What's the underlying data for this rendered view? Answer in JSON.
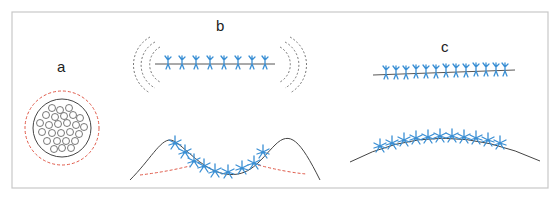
{
  "figure": {
    "panels": [
      {
        "id": "a",
        "label": "a",
        "description": "cross-section of circular structure with internal circles and dashed red outer ring"
      },
      {
        "id": "b",
        "label": "b",
        "description": "straight line with blue stitch marks and dashed grey arcs at ends (top); wavy curve with stitches and red dashed baselines (bottom)"
      },
      {
        "id": "c",
        "label": "c",
        "description": "straight line with blue stitches (top); gently arched curve with blue stitches (bottom)"
      }
    ],
    "colors": {
      "frame": "#c8c8c8",
      "line": "#555555",
      "stitch": "#3a8fd4",
      "red_dashed": "#e05a4a",
      "grey_dashed": "#666666",
      "label": "#222222"
    },
    "caption": ""
  }
}
